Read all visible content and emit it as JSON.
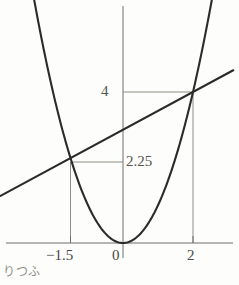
{
  "figure": {
    "caption": "りつふ",
    "axis_color": "#6f6f68",
    "curve_color": "#2b2b28",
    "grid_color": "#8e8e86",
    "background": "#fdfdfb"
  },
  "labels": {
    "x_neg": "−1.5",
    "x_zero": "0",
    "x_two": "2",
    "y_four": "4",
    "y_two_twenty_five": "2.25"
  },
  "chart_data": {
    "type": "line",
    "title": "",
    "xlabel": "",
    "ylabel": "",
    "xlim": [
      -2.7,
      3.3
    ],
    "ylim": [
      -0.2,
      6.4
    ],
    "grid": false,
    "legend": "none",
    "axes": {
      "x_axis_y": 0,
      "y_axis_x": 0,
      "x_ticks": [
        -1.5,
        0,
        2
      ],
      "x_tick_labels": [
        "−1.5",
        "0",
        "2"
      ],
      "y_ticks": [
        2.25,
        4
      ],
      "y_tick_labels": [
        "2.25",
        "4"
      ]
    },
    "series": [
      {
        "name": "parabola",
        "kind": "quadratic",
        "equation": "y = x^2",
        "coefficients": {
          "a": 1,
          "b": 0,
          "c": 0
        },
        "x_range": [
          -2.65,
          2.55
        ],
        "points": [
          {
            "x": -2.65,
            "y": 7.02
          },
          {
            "x": -2.0,
            "y": 4.0
          },
          {
            "x": -1.5,
            "y": 2.25
          },
          {
            "x": -1.0,
            "y": 1.0
          },
          {
            "x": -0.5,
            "y": 0.25
          },
          {
            "x": 0.0,
            "y": 0.0
          },
          {
            "x": 0.5,
            "y": 0.25
          },
          {
            "x": 1.0,
            "y": 1.0
          },
          {
            "x": 1.5,
            "y": 2.25
          },
          {
            "x": 2.0,
            "y": 4.0
          },
          {
            "x": 2.55,
            "y": 6.5
          }
        ]
      },
      {
        "name": "line",
        "kind": "linear",
        "equation": "y = 0.5x + 3",
        "coefficients": {
          "slope": 0.5,
          "intercept": 3.0
        },
        "x_range": [
          -3.5,
          3.15
        ],
        "points": [
          {
            "x": -3.5,
            "y": 1.25
          },
          {
            "x": -1.5,
            "y": 2.25
          },
          {
            "x": 2.0,
            "y": 4.0
          },
          {
            "x": 3.15,
            "y": 4.58
          }
        ]
      }
    ],
    "intersections": [
      {
        "x": -1.5,
        "y": 2.25,
        "label": "(−1.5, 2.25)"
      },
      {
        "x": 2,
        "y": 4,
        "label": "(2, 4)"
      }
    ],
    "droplines": [
      {
        "from": {
          "x": -1.5,
          "y": 2.25
        },
        "to": {
          "x": -1.5,
          "y": 0
        },
        "orientation": "vertical"
      },
      {
        "from": {
          "x": -1.5,
          "y": 2.25
        },
        "to": {
          "x": 0,
          "y": 2.25
        },
        "orientation": "horizontal"
      },
      {
        "from": {
          "x": 2,
          "y": 4
        },
        "to": {
          "x": 2,
          "y": 0
        },
        "orientation": "vertical"
      },
      {
        "from": {
          "x": 2,
          "y": 4
        },
        "to": {
          "x": 0,
          "y": 4
        },
        "orientation": "horizontal"
      }
    ],
    "annotations": [
      {
        "text": "4",
        "x": 0,
        "y": 4,
        "placement": "left-of-axis"
      },
      {
        "text": "2.25",
        "x": 0,
        "y": 2.25,
        "placement": "right-of-axis"
      },
      {
        "text": "−1.5",
        "x": -1.5,
        "y": 0,
        "placement": "below-axis"
      },
      {
        "text": "0",
        "x": 0,
        "y": 0,
        "placement": "below-axis-left"
      },
      {
        "text": "2",
        "x": 2,
        "y": 0,
        "placement": "below-axis"
      }
    ]
  }
}
